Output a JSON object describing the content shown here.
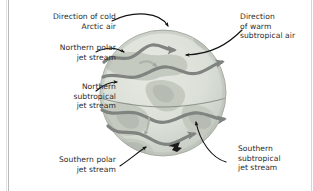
{
  "figure": {
    "type": "diagram",
    "background_color": "#ffffff",
    "globe": {
      "ocean_color": "#d9ddd6",
      "land_color": "#c3c8bf",
      "polar_cap_color": "#b0b5ad",
      "outline_color": "#9aa096",
      "equator_color": "#7c8279",
      "shadow_color": "#b4b9b1"
    },
    "jet_stream_color": "#7f8480",
    "annotation_arrow_color": "#1a1a1a"
  },
  "labels": {
    "cold_arctic": {
      "name": "direction-of-cold-arctic-air",
      "lines": [
        "Direction of cold",
        "Arctic air"
      ],
      "text": "Direction of cold\nArctic air",
      "align": "right"
    },
    "northern_polar_jet": {
      "name": "northern-polar-jet-stream",
      "lines": [
        "Northern polar",
        "jet stream"
      ],
      "text": "Northern polar\njet stream",
      "align": "right"
    },
    "northern_subtropical_jet": {
      "name": "northern-subtropical-jet-stream",
      "lines": [
        "Northern",
        "subtropical",
        "jet stream"
      ],
      "text": "Northern\nsubtropical\njet stream",
      "align": "right"
    },
    "southern_polar_jet": {
      "name": "southern-polar-jet-stream",
      "lines": [
        "Southern polar",
        "jet stream"
      ],
      "text": "Southern polar\njet stream",
      "align": "right"
    },
    "warm_subtropical": {
      "name": "direction-of-warm-subtropical-air",
      "lines": [
        "Direction",
        "of warm",
        "subtropical air"
      ],
      "text": "Direction\nof warm\nsubtropical air",
      "align": "left"
    },
    "southern_subtropical_jet": {
      "name": "southern-subtropical-jet-stream",
      "lines": [
        "Southern",
        "subtropical",
        "jet stream"
      ],
      "text": "Southern\nsubtropical\njet stream",
      "align": "left"
    }
  }
}
